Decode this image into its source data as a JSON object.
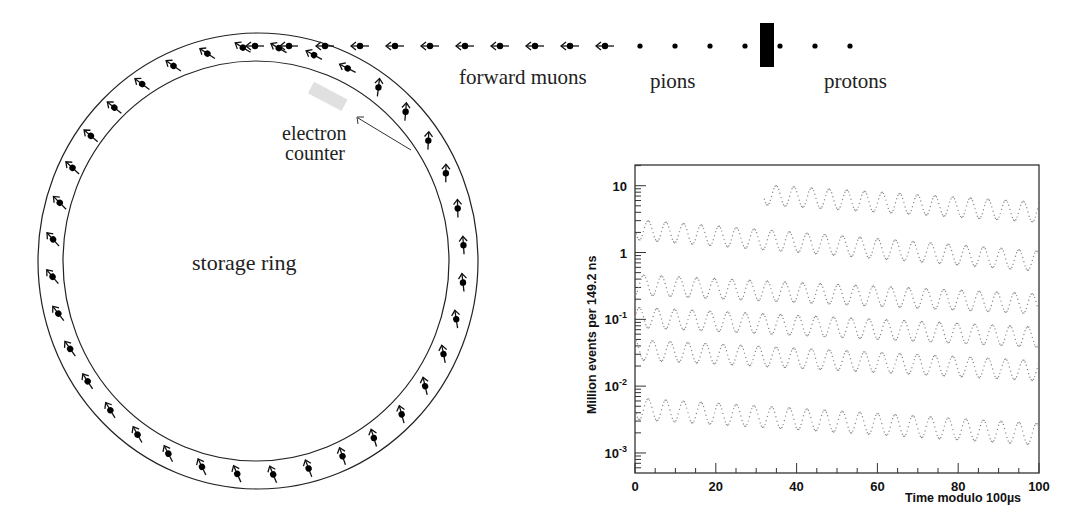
{
  "diagram": {
    "labels": {
      "storage_ring": "storage ring",
      "electron_counter_line1": "electron",
      "electron_counter_line2": "counter",
      "forward_muons": "forward muons",
      "pions": "pions",
      "protons": "protons"
    },
    "ring": {
      "center": [
        258,
        261
      ],
      "outer_radii": [
        220,
        228
      ],
      "inner_radii": [
        193,
        200
      ],
      "particle_count": 36
    },
    "beamline": {
      "y": 46,
      "muon_arrows_x": [
        255,
        289,
        325,
        360,
        395,
        430,
        465,
        500,
        535,
        570,
        605
      ],
      "pion_dots_x": [
        640,
        675,
        710,
        745
      ],
      "proton_dots_x": [
        780,
        815,
        850
      ],
      "target_block": {
        "x": 760,
        "y": 23,
        "w": 14,
        "h": 44
      }
    }
  },
  "chart_data": {
    "type": "scatter",
    "title": "",
    "xlabel": "Time modulo 100µs",
    "ylabel": "Million events per 149.2 ns",
    "xlim": [
      0,
      100
    ],
    "ylim": [
      0.0005,
      20
    ],
    "yscale": "log",
    "x_ticks": [
      0,
      20,
      40,
      60,
      80,
      100
    ],
    "x_tick_labels": [
      "0",
      "20",
      "40",
      "60",
      "80",
      "100"
    ],
    "y_ticks": [
      0.001,
      0.01,
      0.1,
      1,
      10
    ],
    "y_tick_labels": [
      "10^-3",
      "10^-2",
      "10^-1",
      "1",
      "10"
    ],
    "grid": false,
    "legend": null,
    "oscillation_period_us": 4.37,
    "series": [
      {
        "name": "0-100 µs segment",
        "t_start": 32,
        "t_end": 100,
        "center_start": 7.3,
        "center_end": 4.0,
        "amplitude_decades": 0.15
      },
      {
        "name": "100-200 µs segment",
        "t_start": 0,
        "t_end": 100,
        "center_start": 2.2,
        "center_end": 0.74,
        "amplitude_decades": 0.15
      },
      {
        "name": "200-300 µs segment",
        "t_start": 0,
        "t_end": 100,
        "center_start": 0.33,
        "center_end": 0.17,
        "amplitude_decades": 0.15
      },
      {
        "name": "300-400 µs segment",
        "t_start": 0,
        "t_end": 100,
        "center_start": 0.107,
        "center_end": 0.054,
        "amplitude_decades": 0.15
      },
      {
        "name": "400-500 µs segment",
        "t_start": 0,
        "t_end": 100,
        "center_start": 0.035,
        "center_end": 0.017,
        "amplitude_decades": 0.15
      },
      {
        "name": "500-600 µs segment",
        "t_start": 0,
        "t_end": 100,
        "center_start": 0.0046,
        "center_end": 0.0019,
        "amplitude_decades": 0.16
      }
    ],
    "point_color": "#8a8a8a"
  }
}
